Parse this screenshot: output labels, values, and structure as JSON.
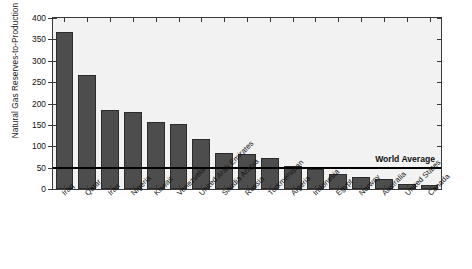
{
  "chart_data": {
    "type": "bar",
    "title": "",
    "xlabel": "",
    "ylabel": "Natural Gas Reserves-to-Production Ratio",
    "ylim": [
      0,
      400
    ],
    "ytick_labels": [
      "0",
      "50",
      "100",
      "150",
      "200",
      "250",
      "300",
      "350",
      "400"
    ],
    "ytick_values": [
      0,
      50,
      100,
      150,
      200,
      250,
      300,
      350,
      400
    ],
    "grid": false,
    "legend": null,
    "bar_color": "#4d4d4d",
    "plot_background": "#f2f2f2",
    "categories": [
      "Iraq",
      "Qatar",
      "Iran",
      "Nigeria",
      "Kuwait",
      "Venezuela",
      "United Arab Emirates",
      "Saudia Arabia",
      "Russia",
      "Turkmenistan",
      "Algeria",
      "Indonesia",
      "Egypt",
      "Norway",
      "Australia",
      "United States",
      "Canada"
    ],
    "values": [
      368,
      267,
      186,
      180,
      157,
      153,
      117,
      84,
      82,
      72,
      54,
      46,
      35,
      27,
      24,
      12,
      10
    ],
    "annotations": [
      {
        "name": "world-average",
        "label": "World Average",
        "value": 52,
        "type": "horizontal-line",
        "color": "#000000"
      }
    ]
  }
}
